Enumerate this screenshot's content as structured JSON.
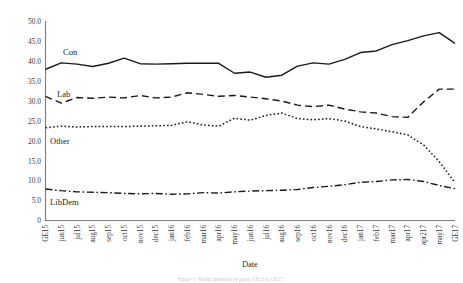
{
  "chart_data": {
    "type": "line",
    "title": "",
    "xlabel": "Date",
    "ylabel": "",
    "ylim": [
      0,
      50
    ],
    "yticks": [
      "0",
      "5.0",
      "10.0",
      "15.0",
      "20.0",
      "25.0",
      "30.0",
      "35.0",
      "40.0",
      "45.0",
      "50.0"
    ],
    "grid": false,
    "legend_position": "inline-labels",
    "categories": [
      "GE15",
      "jun15",
      "jul15",
      "aug15",
      "sep15",
      "oct15",
      "nov15",
      "dec15",
      "jan16",
      "feb16",
      "mar16",
      "apr16",
      "may16",
      "jun16",
      "jul16",
      "aug16",
      "sep16",
      "oct16",
      "nov16",
      "dec16",
      "jan17",
      "feb17",
      "mar17",
      "apr17",
      "apr217",
      "may17",
      "GE17"
    ],
    "series": [
      {
        "name": "Con",
        "style": "solid",
        "values": [
          38.0,
          39.6,
          39.3,
          38.7,
          39.5,
          40.8,
          39.4,
          39.3,
          39.4,
          39.5,
          39.5,
          39.5,
          37.0,
          37.3,
          36.0,
          36.5,
          38.8,
          39.6,
          39.3,
          40.5,
          42.2,
          42.6,
          44.2,
          45.2,
          46.4,
          47.2,
          44.5
        ]
      },
      {
        "name": "Lab",
        "style": "dashed",
        "values": [
          31.2,
          29.5,
          30.9,
          30.7,
          31.0,
          30.8,
          31.4,
          30.8,
          31.0,
          32.1,
          31.7,
          31.2,
          31.4,
          31.0,
          30.6,
          30.0,
          29.0,
          28.6,
          29.0,
          28.0,
          27.3,
          27.0,
          26.1,
          25.9,
          29.8,
          33.0,
          33.0
        ]
      },
      {
        "name": "Other",
        "style": "dotted",
        "values": [
          23.3,
          23.7,
          23.5,
          23.6,
          23.6,
          23.6,
          23.7,
          23.8,
          23.9,
          24.8,
          24.0,
          23.7,
          25.7,
          25.2,
          26.4,
          27.0,
          25.6,
          25.3,
          25.6,
          25.0,
          23.6,
          23.0,
          22.3,
          21.5,
          19.0,
          14.8,
          9.5
        ]
      },
      {
        "name": "LibDem",
        "style": "dashdot",
        "values": [
          7.9,
          7.5,
          7.2,
          7.1,
          7.0,
          6.8,
          6.7,
          6.8,
          6.6,
          6.7,
          7.0,
          6.9,
          7.2,
          7.4,
          7.5,
          7.6,
          7.8,
          8.3,
          8.6,
          9.0,
          9.6,
          9.8,
          10.2,
          10.3,
          9.8,
          8.8,
          8.0
        ]
      }
    ]
  },
  "axis": {
    "x_title": "Date"
  },
  "series_labels": [
    {
      "name": "Con",
      "x": 63,
      "y": 55
    },
    {
      "name": "Lab",
      "x": 57,
      "y": 97
    },
    {
      "name": "Other",
      "x": 50,
      "y": 144
    },
    {
      "name": "LibDem",
      "x": 50,
      "y": 205
    }
  ],
  "caption": {
    "text": "Figure 1: Voting intention by party, GE15 to GE17."
  }
}
